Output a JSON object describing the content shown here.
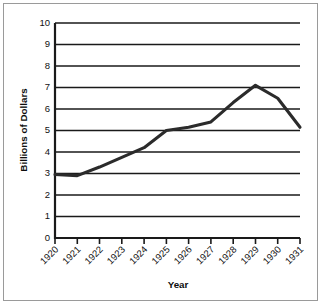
{
  "chart_data": {
    "type": "line",
    "title": "",
    "xlabel": "Year",
    "ylabel": "Billions of Dollars",
    "categories": [
      "1920",
      "1921",
      "1922",
      "1923",
      "1924",
      "1925",
      "1926",
      "1927",
      "1928",
      "1929",
      "1930",
      "1931"
    ],
    "x": [
      1920,
      1921,
      1922,
      1923,
      1924,
      1925,
      1926,
      1927,
      1928,
      1929,
      1930,
      1931
    ],
    "values": [
      2.95,
      2.9,
      3.3,
      3.75,
      4.2,
      5.0,
      5.15,
      5.4,
      6.3,
      7.1,
      6.5,
      5.15
    ],
    "series": [
      {
        "name": "Billions of Dollars",
        "values": [
          2.95,
          2.9,
          3.3,
          3.75,
          4.2,
          5.0,
          5.15,
          5.4,
          6.3,
          7.1,
          6.5,
          5.15
        ],
        "color": "#2b2b2b"
      }
    ],
    "ylim": [
      0,
      10
    ],
    "ytick_labels": [
      "0",
      "1",
      "2",
      "3",
      "4",
      "5",
      "6",
      "7",
      "8",
      "9",
      "10"
    ],
    "yticks": [
      0,
      1,
      2,
      3,
      4,
      5,
      6,
      7,
      8,
      9,
      10
    ],
    "grid": "horizontal",
    "legend": "none",
    "xtick_rotation": 45,
    "annotations": []
  },
  "colors": {
    "line": "#2b2b2b",
    "grid": "#1a1a1a",
    "axis": "#1a1a1a",
    "text": "#111111",
    "background": "#ffffff",
    "frame": "#9a9a9a"
  }
}
